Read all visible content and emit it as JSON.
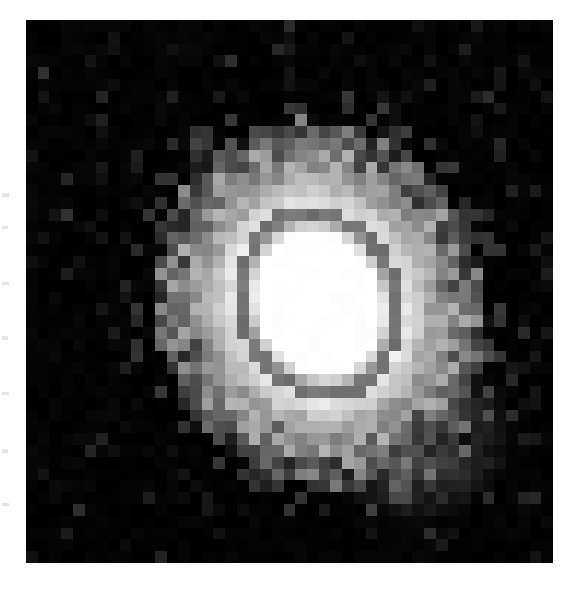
{
  "figure": {
    "kind": "astronomical-greyscale-image",
    "background_color": "#000000",
    "page_color": "#ffffff",
    "canvas_width": 577,
    "canvas_height": 591
  },
  "image_field": {
    "left": 26,
    "top": 20,
    "width": 527,
    "height": 543,
    "block_size": 11.7,
    "grid_cols": 45,
    "grid_rows": 46
  },
  "margins": {
    "left": 26,
    "top": 20,
    "right": 24,
    "bottom": 28
  },
  "greyscale_levels": {
    "black": "#000000",
    "noise_faint": "#101010",
    "noise_low": "#1d1d1d",
    "halo_dark": "#3a3a3a",
    "halo_mid": "#585858",
    "contour_ring": "#6e6e6e",
    "halo_bright": "#9b9b9b",
    "ring_light": "#d8d8d8",
    "core_white": "#ffffff"
  },
  "source_structure": {
    "core": {
      "center_col": 25,
      "center_row": 24,
      "semi_axis_cols": 5.2,
      "semi_axis_rows": 6.4,
      "tilt_deg": -20,
      "level": "core_white"
    },
    "contour_ring": {
      "semi_axis_cols": 7.0,
      "semi_axis_rows": 8.3,
      "level": "contour_ring"
    },
    "bright_ring": {
      "semi_axis_cols": 8.6,
      "semi_axis_rows": 10.0,
      "level": "ring_light"
    },
    "outer_halo": {
      "semi_axis_cols": 11.2,
      "semi_axis_rows": 12.6,
      "level": "halo_mid"
    },
    "plume": {
      "direction": "lower-right",
      "center_col": 33,
      "center_row": 35,
      "extent_cols": 9,
      "extent_rows": 8,
      "level": "halo_mid"
    }
  },
  "chart_data": {
    "type": "heatmap",
    "title": "",
    "xlabel": "",
    "ylabel": "",
    "colormap": "greyscale",
    "vmin": 0,
    "vmax": 255,
    "grid": false,
    "legend": "none",
    "nx": 45,
    "ny": 46,
    "note": "Pixel intensity map of galaxy; values 0=black sky background, 255=saturated core"
  },
  "margin_ticks": [
    {
      "x": 2,
      "y": 193,
      "w": 7,
      "h": 4
    },
    {
      "x": 2,
      "y": 226,
      "w": 6,
      "h": 3
    },
    {
      "x": 2,
      "y": 282,
      "w": 7,
      "h": 3
    },
    {
      "x": 2,
      "y": 336,
      "w": 6,
      "h": 4
    },
    {
      "x": 2,
      "y": 392,
      "w": 7,
      "h": 3
    },
    {
      "x": 2,
      "y": 449,
      "w": 6,
      "h": 4
    },
    {
      "x": 2,
      "y": 503,
      "w": 7,
      "h": 3
    }
  ]
}
